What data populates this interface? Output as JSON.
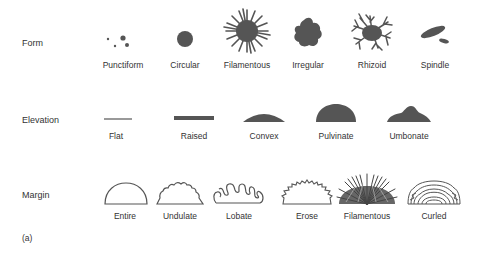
{
  "figure": {
    "panel_label": "(a)",
    "fill_color": "#555555",
    "outline_color": "#555555",
    "rows": [
      {
        "name": "Form",
        "items": [
          "Punctiform",
          "Circular",
          "Filamentous",
          "Irregular",
          "Rhizoid",
          "Spindle"
        ]
      },
      {
        "name": "Elevation",
        "items": [
          "Flat",
          "Raised",
          "Convex",
          "Pulvinate",
          "Umbonate"
        ]
      },
      {
        "name": "Margin",
        "items": [
          "Entire",
          "Undulate",
          "Lobate",
          "Erose",
          "Filamentous",
          "Curled"
        ]
      }
    ]
  }
}
